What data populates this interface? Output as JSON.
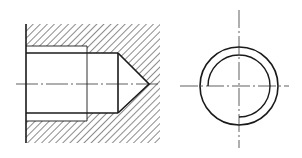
{
  "drawing": {
    "title": "Blind threaded hole - section and end view",
    "colors": {
      "line": "#1a1a1a",
      "background": "#ffffff"
    },
    "section_view": {
      "block": {
        "left": 26,
        "top": 24,
        "right": 160,
        "bottom": 143
      },
      "thread_major": {
        "top": 46,
        "bottom": 121,
        "end_x": 87
      },
      "thread_minor": {
        "top": 53,
        "bottom": 113,
        "end_x": 118
      },
      "drill_tip": {
        "x": 149,
        "y": 84
      },
      "centerline_y": 84
    },
    "end_view": {
      "center": {
        "x": 239,
        "y": 86
      },
      "outer_radius": 39,
      "inner_arc_radius": 31,
      "inner_arc": "three-quarter"
    }
  }
}
